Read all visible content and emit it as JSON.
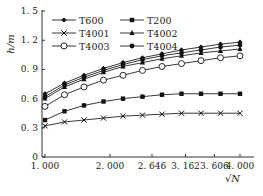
{
  "chart_data": {
    "type": "line",
    "title": "",
    "xlabel": "√N",
    "ylabel": "h/m",
    "xlim": [
      1.0,
      4.0
    ],
    "ylim": [
      0,
      1.5
    ],
    "x_ticks": [
      "1.000",
      "2.000",
      "2.646",
      "3.162",
      "3.606",
      "4.000"
    ],
    "y_ticks": [
      "0",
      "0.3",
      "0.6",
      "0.9",
      "1.2",
      "1.5"
    ],
    "grid": false,
    "legend_position": "top-left inside",
    "x": [
      1.0,
      1.3,
      1.6,
      1.9,
      2.2,
      2.5,
      2.8,
      3.1,
      3.4,
      3.7,
      4.0
    ],
    "series": [
      {
        "name": "T600",
        "marker": "diamond-filled",
        "values": [
          0.65,
          0.76,
          0.84,
          0.91,
          0.97,
          1.02,
          1.06,
          1.1,
          1.13,
          1.16,
          1.18
        ]
      },
      {
        "name": "T200",
        "marker": "square-filled",
        "values": [
          0.38,
          0.47,
          0.53,
          0.57,
          0.6,
          0.62,
          0.64,
          0.65,
          0.65,
          0.65,
          0.65
        ]
      },
      {
        "name": "T4001",
        "marker": "x",
        "values": [
          0.32,
          0.36,
          0.38,
          0.4,
          0.42,
          0.43,
          0.44,
          0.45,
          0.45,
          0.45,
          0.45
        ]
      },
      {
        "name": "T4002",
        "marker": "triangle-filled",
        "values": [
          0.6,
          0.72,
          0.8,
          0.87,
          0.93,
          0.97,
          1.01,
          1.04,
          1.07,
          1.09,
          1.11
        ]
      },
      {
        "name": "T4003",
        "marker": "circle-open",
        "values": [
          0.52,
          0.64,
          0.72,
          0.79,
          0.84,
          0.89,
          0.93,
          0.96,
          0.99,
          1.02,
          1.04
        ]
      },
      {
        "name": "T4004",
        "marker": "circle-filled",
        "values": [
          0.62,
          0.74,
          0.82,
          0.89,
          0.95,
          1.0,
          1.04,
          1.07,
          1.1,
          1.13,
          1.15
        ]
      }
    ]
  }
}
